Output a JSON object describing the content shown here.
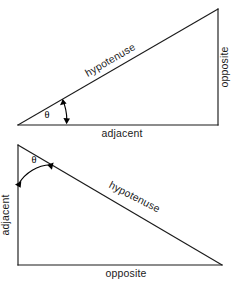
{
  "figure": {
    "stroke_color": "#1b1b1b",
    "text_color": "#1b1b1b",
    "background_color": "#ffffff",
    "angle_symbol": "θ"
  },
  "triangles": [
    {
      "id": "triangle-top",
      "name": "shallow-right-triangle",
      "orientation": "right-angle-at-bottom-right",
      "angle_label": "θ",
      "vertices": {
        "angle_vertex": [
          18,
          125
        ],
        "right_angle_vertex": [
          218,
          125
        ],
        "apex_vertex": [
          218,
          9
        ]
      },
      "labels": {
        "hypotenuse": "hypotenuse",
        "opposite": "opposite",
        "adjacent": "adjacent"
      },
      "label_rotations": {
        "hypotenuse": -30,
        "opposite": -90,
        "adjacent": 0
      }
    },
    {
      "id": "triangle-bottom",
      "name": "steep-right-triangle",
      "orientation": "right-angle-at-bottom-left",
      "angle_label": "θ",
      "vertices": {
        "angle_vertex": [
          18,
          145
        ],
        "right_angle_vertex": [
          18,
          265
        ],
        "apex_vertex": [
          222,
          265
        ]
      },
      "labels": {
        "hypotenuse": "hypotenuse",
        "opposite": "opposite",
        "adjacent": "adjacent"
      },
      "label_rotations": {
        "hypotenuse": 27,
        "adjacent": -90,
        "opposite": 0
      }
    }
  ],
  "text_items": {
    "t1_hypotenuse": "hypotenuse",
    "t1_opposite": "opposite",
    "t1_adjacent": "adjacent",
    "t1_theta": "θ",
    "t2_hypotenuse": "hypotenuse",
    "t2_adjacent": "adjacent",
    "t2_opposite": "opposite",
    "t2_theta": "θ"
  }
}
